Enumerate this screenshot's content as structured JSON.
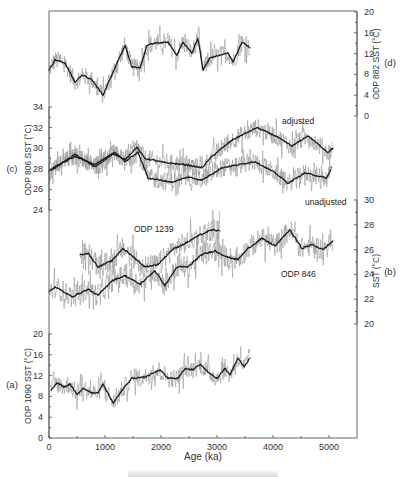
{
  "chart_data": {
    "type": "line",
    "title": "",
    "xlabel": "Age (ka)",
    "xlim": [
      0,
      5500
    ],
    "xticks": [
      0,
      1000,
      2000,
      3000,
      4000,
      5000
    ],
    "caption": "",
    "colors": {
      "raw": "#9a9a9a",
      "smooth": "#1a1a1a",
      "axis": "#555555"
    },
    "panels": [
      {
        "id": "d",
        "letter": "(d)",
        "axis_side": "right",
        "ylabel": "ODP 882 SST (°C)",
        "ylim": [
          0,
          20
        ],
        "yticks": [
          0,
          4,
          8,
          12,
          16,
          20
        ],
        "annotations": [],
        "series": [
          {
            "name": "ODP 882 smoothed",
            "x": [
              0,
              107,
              285,
              465,
              590,
              770,
              965,
              1180,
              1360,
              1480,
              1625,
              1750,
              1890,
              2125,
              2285,
              2390,
              2550,
              2660,
              2750,
              2875,
              3200,
              3285,
              3450,
              3590
            ],
            "y": [
              8.8,
              10.8,
              10.2,
              6.5,
              7.9,
              6.9,
              4.0,
              9.4,
              13.6,
              9.4,
              9.2,
              13.6,
              14.0,
              14.2,
              11.7,
              14.2,
              12.1,
              15.0,
              8.8,
              11.2,
              12.1,
              10.4,
              14.2,
              13.1
            ]
          }
        ]
      },
      {
        "id": "c",
        "letter": "(c)",
        "axis_side": "left",
        "ylabel": "ODP 806 SST (°C)",
        "ylim": [
          24,
          34
        ],
        "yticks": [
          24,
          26,
          28,
          30,
          32,
          34
        ],
        "annotations": [
          "adjusted",
          "unadjusted"
        ],
        "series": [
          {
            "name": "adjusted",
            "x": [
              0,
              107,
              465,
              820,
              1125,
              1360,
              1570,
              1715,
              2070,
              2430,
              2730,
              2910,
              3270,
              3715,
              4040,
              4340,
              4625,
              4980,
              5070
            ],
            "y": [
              27.8,
              28.2,
              29.2,
              28.4,
              29.5,
              28.9,
              30.1,
              29.0,
              28.6,
              28.4,
              28.1,
              29.2,
              30.8,
              32.0,
              31.2,
              30.2,
              31.2,
              29.6,
              30.0
            ]
          },
          {
            "name": "unadjusted",
            "x": [
              0,
              107,
              465,
              820,
              1180,
              1360,
              1590,
              1770,
              2200,
              2480,
              2730,
              3090,
              3680,
              4040,
              4270,
              4570,
              4960,
              5050
            ],
            "y": [
              27.8,
              28.1,
              29.4,
              28.2,
              29.6,
              28.7,
              29.6,
              27.1,
              26.7,
              27.2,
              26.9,
              28.1,
              28.7,
              27.6,
              26.6,
              27.6,
              27.1,
              28.1
            ]
          }
        ]
      },
      {
        "id": "b",
        "letter": "(b)",
        "axis_side": "right",
        "ylabel": "SST (°C)",
        "ylim": [
          20,
          30
        ],
        "yticks": [
          20,
          22,
          24,
          26,
          28,
          30
        ],
        "annotations": [
          "ODP 1239",
          "ODP 846"
        ],
        "series": [
          {
            "name": "ODP 846",
            "x": [
              0,
              107,
              410,
              700,
              875,
              1125,
              1360,
              1625,
              1890,
              2070,
              2285,
              2480,
              2730,
              2965,
              3180,
              3375,
              3555,
              3800,
              4040,
              4300,
              4515,
              4700,
              4895,
              5070
            ],
            "y": [
              22.6,
              23.0,
              22.2,
              22.8,
              22.3,
              23.5,
              23.9,
              23.2,
              24.3,
              23.1,
              24.6,
              24.6,
              25.6,
              25.9,
              25.4,
              25.2,
              26.1,
              26.9,
              26.3,
              27.6,
              26.1,
              26.4,
              26.0,
              26.7
            ]
          },
          {
            "name": "ODP 1239",
            "x": [
              555,
              700,
              875,
              1125,
              1320,
              1535,
              1715,
              1945,
              2200,
              2430,
              2660,
              2910,
              3055
            ],
            "y": [
              25.6,
              25.7,
              24.6,
              25.1,
              26.1,
              25.3,
              24.6,
              24.8,
              26.0,
              26.5,
              27.1,
              27.6,
              27.5
            ]
          }
        ]
      },
      {
        "id": "a",
        "letter": "(a)",
        "axis_side": "left",
        "ylabel": "ODP 1090 SST (°C)",
        "ylim": [
          0,
          20
        ],
        "yticks": [
          0,
          4,
          8,
          12,
          16,
          20
        ],
        "annotations": [],
        "series": [
          {
            "name": "ODP 1090 smoothed",
            "x": [
              40,
              140,
              285,
              375,
              500,
              610,
              770,
              875,
              965,
              1145,
              1305,
              1480,
              1715,
              1980,
              2125,
              2305,
              2430,
              2570,
              2700,
              2840,
              3000,
              3145,
              3230,
              3375,
              3485,
              3590
            ],
            "y": [
              9.2,
              10.6,
              9.8,
              10.4,
              8.3,
              9.6,
              8.7,
              8.7,
              10.4,
              6.7,
              9.2,
              11.5,
              11.7,
              13.1,
              11.5,
              11.5,
              13.4,
              13.1,
              14.2,
              12.7,
              11.5,
              13.4,
              12.1,
              15.4,
              13.7,
              15.4
            ]
          }
        ]
      }
    ]
  }
}
